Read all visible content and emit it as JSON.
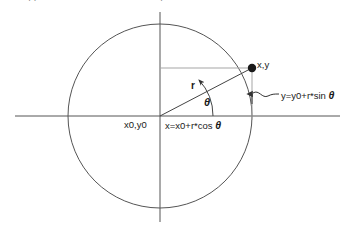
{
  "diagram": {
    "type": "geometry-diagram",
    "colors": {
      "stroke": "#555555",
      "axis": "#555555",
      "guide": "#9a9a9a",
      "point": "#1a1a1a",
      "text": "#1a1a1a",
      "background": "#ffffff"
    },
    "geometry": {
      "center": {
        "x": 160,
        "y": 116
      },
      "radius": 92,
      "point": {
        "x": 252,
        "y": 68
      },
      "angle_degrees": 27,
      "x_axis": {
        "x1": 15,
        "x2": 340,
        "y": 116
      },
      "y_axis": {
        "x": 160,
        "y1": 12,
        "y2": 222
      }
    },
    "labels": {
      "point": "x,y",
      "origin": "x0,y0",
      "radius": "r",
      "angle": "θ",
      "x_equation_prefix": "x=x0+r*cos ",
      "x_equation_symbol": "θ",
      "y_equation_prefix": "y=y0+r*sin ",
      "y_equation_symbol": "θ"
    },
    "top_fragments": [
      {
        "text": "· ·",
        "left": 28
      },
      {
        "text": "·",
        "left": 160
      }
    ]
  }
}
